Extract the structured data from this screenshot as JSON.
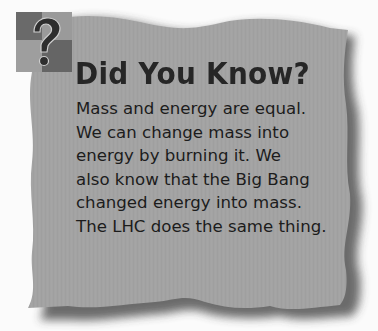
{
  "callout": {
    "icon": "question-mark-icon",
    "title": "Did You Know?",
    "lines": [
      "Mass and energy are equal.",
      "We can change mass into",
      "energy by burning it. We",
      "also know that the Big Bang",
      "changed energy into mass.",
      "The LHC does the same thing."
    ]
  },
  "colors": {
    "background": "#fbfbfb",
    "card_fill": "#a3a3a3",
    "card_shadow": "#3a3a3a",
    "title_text": "#262626",
    "body_text": "#1c1c1c",
    "icon_dark": "#6e6e6e",
    "icon_light": "#9a9a9a"
  }
}
